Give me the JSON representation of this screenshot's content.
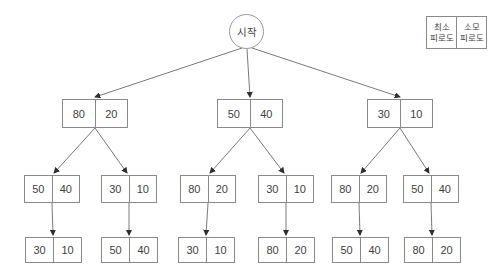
{
  "root": {
    "label": "시작"
  },
  "legend": {
    "items": [
      {
        "line1": "최소",
        "line2": "피로도"
      },
      {
        "line1": "소모",
        "line2": "피로도"
      }
    ]
  },
  "tree": {
    "level2": [
      {
        "left": "80",
        "right": "20"
      },
      {
        "left": "50",
        "right": "40"
      },
      {
        "left": "30",
        "right": "10"
      }
    ],
    "level3": [
      {
        "left": "50",
        "right": "40"
      },
      {
        "left": "30",
        "right": "10"
      },
      {
        "left": "80",
        "right": "20"
      },
      {
        "left": "30",
        "right": "10"
      },
      {
        "left": "80",
        "right": "20"
      },
      {
        "left": "50",
        "right": "40"
      }
    ],
    "level4": [
      {
        "left": "30",
        "right": "10"
      },
      {
        "left": "50",
        "right": "40"
      },
      {
        "left": "30",
        "right": "10"
      },
      {
        "left": "80",
        "right": "20"
      },
      {
        "left": "50",
        "right": "40"
      },
      {
        "left": "80",
        "right": "20"
      }
    ]
  }
}
